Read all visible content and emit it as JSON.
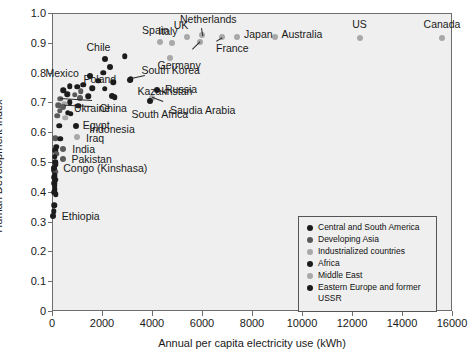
{
  "chart_data": {
    "type": "scatter",
    "title": "",
    "xlabel": "Annual per capita electricity use (kWh)",
    "ylabel": "Human Development Index",
    "xlim": [
      0,
      16000
    ],
    "ylim": [
      0,
      1.0
    ],
    "xticks": [
      "0",
      "2000",
      "4000",
      "6000",
      "8000",
      "10000",
      "12000",
      "14000",
      "16000"
    ],
    "yticks": [
      "0",
      "0.1",
      "0.2",
      "0.3",
      "0.4",
      "0.5",
      "0.6",
      "0.7",
      "0.8",
      "0.9",
      "1.0"
    ],
    "grid": false,
    "legend_position": "lower right",
    "series": [
      {
        "name": "Central and South America",
        "color": "#1c1c1c"
      },
      {
        "name": "Developing Asia",
        "color": "#5a5a5a"
      },
      {
        "name": "Industrialized countries",
        "color": "#a8a8a8"
      },
      {
        "name": "Africa",
        "color": "#1c1c1c"
      },
      {
        "name": "Middle East",
        "color": "#a8a8a8"
      },
      {
        "name": "Eastern Europe and former USSR",
        "color": "#1c1c1c"
      }
    ],
    "points": [
      {
        "label": "Canada",
        "x": 15600,
        "y": 0.915,
        "group": 2
      },
      {
        "label": "US",
        "x": 12300,
        "y": 0.917,
        "group": 2
      },
      {
        "label": "Australia",
        "x": 8900,
        "y": 0.92,
        "group": 2
      },
      {
        "label": "Japan",
        "x": 7400,
        "y": 0.92,
        "group": 2
      },
      {
        "label": "France",
        "x": 6800,
        "y": 0.918,
        "group": 2
      },
      {
        "label": "Germany",
        "x": 5900,
        "y": 0.902,
        "group": 2
      },
      {
        "label": "Netherlands",
        "x": 6000,
        "y": 0.925,
        "group": 2
      },
      {
        "label": "UK",
        "x": 5400,
        "y": 0.918,
        "group": 2
      },
      {
        "label": "Italy",
        "x": 4800,
        "y": 0.9,
        "group": 2
      },
      {
        "label": "Spain",
        "x": 4300,
        "y": 0.902,
        "group": 2
      },
      {
        "label": "South Korea",
        "x": 4700,
        "y": 0.85,
        "group": 2
      },
      {
        "label": "Chile",
        "x": 2100,
        "y": 0.845,
        "group": 0
      },
      {
        "label": "Poland",
        "x": 2300,
        "y": 0.82,
        "group": 5
      },
      {
        "label": "Kazakhstan",
        "x": 3100,
        "y": 0.775,
        "group": 5
      },
      {
        "label": "Russia",
        "x": 4200,
        "y": 0.742,
        "group": 5
      },
      {
        "label": "Saudia Arabia",
        "x": 4000,
        "y": 0.715,
        "group": 4
      },
      {
        "label": "South Africa",
        "x": 3900,
        "y": 0.705,
        "group": 3
      },
      {
        "label": "Ukraine",
        "x": 2400,
        "y": 0.72,
        "group": 5
      },
      {
        "label": "Mexico",
        "x": 1500,
        "y": 0.79,
        "group": 0
      },
      {
        "label": "China",
        "x": 1100,
        "y": 0.715,
        "group": 1
      },
      {
        "label": "Indonesia",
        "x": 450,
        "y": 0.685,
        "group": 1
      },
      {
        "label": "Egypt",
        "x": 950,
        "y": 0.62,
        "group": 3
      },
      {
        "label": "Iraq",
        "x": 1000,
        "y": 0.585,
        "group": 4
      },
      {
        "label": "India",
        "x": 450,
        "y": 0.545,
        "group": 1
      },
      {
        "label": "Pakistan",
        "x": 420,
        "y": 0.51,
        "group": 1
      },
      {
        "label": "Congo (Kinshasa)",
        "x": 90,
        "y": 0.48,
        "group": 3
      },
      {
        "label": "Ethiopia",
        "x": 30,
        "y": 0.32,
        "group": 3
      }
    ],
    "unlabeled_points": [
      {
        "x": 2900,
        "y": 0.855,
        "group": 0
      },
      {
        "x": 2050,
        "y": 0.8,
        "group": 5
      },
      {
        "x": 3150,
        "y": 0.778,
        "group": 5
      },
      {
        "x": 1850,
        "y": 0.772,
        "group": 5
      },
      {
        "x": 1250,
        "y": 0.76,
        "group": 0
      },
      {
        "x": 2450,
        "y": 0.768,
        "group": 5
      },
      {
        "x": 700,
        "y": 0.755,
        "group": 0
      },
      {
        "x": 1000,
        "y": 0.752,
        "group": 0
      },
      {
        "x": 1600,
        "y": 0.748,
        "group": 0
      },
      {
        "x": 2100,
        "y": 0.745,
        "group": 5
      },
      {
        "x": 450,
        "y": 0.74,
        "group": 0
      },
      {
        "x": 1150,
        "y": 0.738,
        "group": 1
      },
      {
        "x": 600,
        "y": 0.728,
        "group": 0
      },
      {
        "x": 900,
        "y": 0.725,
        "group": 1
      },
      {
        "x": 1450,
        "y": 0.72,
        "group": 0
      },
      {
        "x": 2500,
        "y": 0.718,
        "group": 5
      },
      {
        "x": 330,
        "y": 0.712,
        "group": 1
      },
      {
        "x": 700,
        "y": 0.7,
        "group": 0
      },
      {
        "x": 480,
        "y": 0.695,
        "group": 4
      },
      {
        "x": 250,
        "y": 0.69,
        "group": 1
      },
      {
        "x": 1050,
        "y": 0.688,
        "group": 0
      },
      {
        "x": 300,
        "y": 0.672,
        "group": 1
      },
      {
        "x": 620,
        "y": 0.665,
        "group": 0
      },
      {
        "x": 750,
        "y": 0.662,
        "group": 3
      },
      {
        "x": 200,
        "y": 0.655,
        "group": 1
      },
      {
        "x": 520,
        "y": 0.648,
        "group": 4
      },
      {
        "x": 280,
        "y": 0.622,
        "group": 3
      },
      {
        "x": 120,
        "y": 0.58,
        "group": 1
      },
      {
        "x": 330,
        "y": 0.578,
        "group": 3
      },
      {
        "x": 160,
        "y": 0.552,
        "group": 3
      },
      {
        "x": 130,
        "y": 0.54,
        "group": 3
      },
      {
        "x": 170,
        "y": 0.528,
        "group": 1
      },
      {
        "x": 110,
        "y": 0.518,
        "group": 3
      },
      {
        "x": 120,
        "y": 0.5,
        "group": 3
      },
      {
        "x": 140,
        "y": 0.492,
        "group": 3
      },
      {
        "x": 95,
        "y": 0.472,
        "group": 3
      },
      {
        "x": 150,
        "y": 0.468,
        "group": 1
      },
      {
        "x": 105,
        "y": 0.455,
        "group": 3
      },
      {
        "x": 90,
        "y": 0.448,
        "group": 3
      },
      {
        "x": 130,
        "y": 0.44,
        "group": 3
      },
      {
        "x": 85,
        "y": 0.428,
        "group": 3
      },
      {
        "x": 100,
        "y": 0.42,
        "group": 3
      },
      {
        "x": 110,
        "y": 0.408,
        "group": 3
      },
      {
        "x": 80,
        "y": 0.398,
        "group": 3
      },
      {
        "x": 150,
        "y": 0.392,
        "group": 3
      },
      {
        "x": 90,
        "y": 0.355,
        "group": 3
      },
      {
        "x": 60,
        "y": 0.335,
        "group": 3
      }
    ],
    "leaders": [
      {
        "from": [
          6000,
          0.948
        ],
        "to": [
          6050,
          0.922
        ]
      },
      {
        "from": [
          6550,
          0.905
        ],
        "to": [
          6800,
          0.918
        ]
      },
      {
        "from": [
          5600,
          0.878
        ],
        "to": [
          5900,
          0.903
        ]
      },
      {
        "from": [
          3700,
          0.788
        ],
        "to": [
          3150,
          0.778
        ]
      },
      {
        "from": [
          4600,
          0.728
        ],
        "to": [
          4200,
          0.742
        ]
      },
      {
        "from": [
          4450,
          0.702
        ],
        "to": [
          4020,
          0.716
        ]
      },
      {
        "from": [
          1600,
          0.705
        ],
        "to": [
          330,
          0.712
        ]
      },
      {
        "from": [
          1600,
          0.683
        ],
        "to": [
          470,
          0.687
        ]
      }
    ]
  }
}
